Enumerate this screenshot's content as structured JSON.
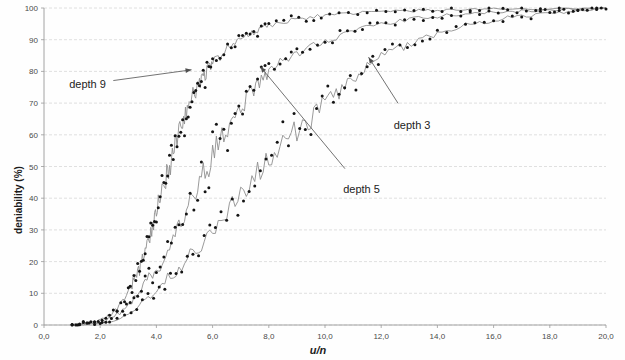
{
  "chart_data": {
    "type": "line",
    "title": "",
    "xlabel": "u/n",
    "ylabel": "deniability (%)",
    "xlim": [
      0.0,
      20.0
    ],
    "ylim": [
      0,
      100
    ],
    "grid": true,
    "legend_position": "inline-annotations",
    "x_tick_labels": [
      "0,0",
      "2,0",
      "4,0",
      "6,0",
      "8,0",
      "10,0",
      "12,0",
      "14,0",
      "16,0",
      "18,0",
      "20,0"
    ],
    "x_tick_values": [
      0,
      2,
      4,
      6,
      8,
      10,
      12,
      14,
      16,
      18,
      20
    ],
    "y_tick_labels": [
      "0",
      "10",
      "20",
      "30",
      "40",
      "50",
      "60",
      "70",
      "80",
      "90",
      "100"
    ],
    "y_tick_values": [
      0,
      10,
      20,
      30,
      40,
      50,
      60,
      70,
      80,
      90,
      100
    ],
    "annotations": [
      {
        "text": "depth 9",
        "label_x": 1.55,
        "label_y": 76,
        "point_x": 5.25,
        "point_y": 80.5
      },
      {
        "text": "depth 3",
        "label_x": 13.1,
        "label_y": 63,
        "point_x": 11.55,
        "point_y": 84.5
      },
      {
        "text": "depth 5",
        "label_x": 11.3,
        "label_y": 43,
        "point_x": 7.7,
        "point_y": 81.5
      }
    ],
    "series": [
      {
        "name": "depth 9",
        "color": "#141414",
        "x": [
          1.0,
          1.2,
          1.4,
          1.6,
          1.8,
          2.0,
          2.2,
          2.4,
          2.6,
          2.8,
          3.0,
          3.1,
          3.2,
          3.3,
          3.4,
          3.5,
          3.6,
          3.7,
          3.8,
          3.9,
          4.0,
          4.1,
          4.2,
          4.3,
          4.4,
          4.5,
          4.6,
          4.7,
          4.8,
          4.9,
          5.0,
          5.1,
          5.2,
          5.3,
          5.4,
          5.5,
          5.6,
          5.7,
          5.8,
          5.9,
          6.0,
          6.2,
          6.4,
          6.6,
          6.8,
          7.0,
          7.2,
          7.4,
          7.6,
          7.8,
          8.0,
          8.4,
          8.8,
          9.2,
          9.6,
          10.0,
          10.5,
          11.0,
          11.5,
          12.0,
          12.5,
          13.0,
          13.5,
          14.0,
          14.5,
          15.0,
          15.5,
          16.0,
          17.0,
          18.0,
          19.0,
          20.0
        ],
        "y": [
          0.2,
          0.3,
          0.4,
          0.6,
          0.9,
          1.4,
          2.2,
          3.4,
          5.0,
          7.4,
          10.5,
          12.0,
          14.2,
          16.8,
          17.2,
          20.8,
          24.4,
          25.8,
          29.6,
          32.0,
          35.4,
          38.8,
          41.0,
          44.8,
          48.0,
          51.5,
          54.8,
          57.6,
          60.8,
          63.0,
          65.8,
          68.5,
          70.2,
          72.6,
          74.0,
          75.6,
          77.4,
          78.8,
          80.2,
          81.0,
          82.4,
          84.6,
          86.0,
          87.8,
          89.0,
          90.2,
          91.4,
          92.2,
          93.0,
          93.8,
          94.4,
          95.4,
          96.2,
          96.8,
          97.2,
          97.6,
          98.0,
          98.3,
          98.6,
          98.8,
          99.0,
          99.1,
          99.2,
          99.3,
          99.4,
          99.5,
          99.5,
          99.6,
          99.7,
          99.8,
          99.9,
          100.0
        ]
      },
      {
        "name": "depth 5",
        "color": "#141414",
        "x": [
          1.0,
          1.3,
          1.6,
          1.9,
          2.2,
          2.5,
          2.8,
          3.0,
          3.2,
          3.4,
          3.6,
          3.8,
          4.0,
          4.2,
          4.4,
          4.6,
          4.8,
          5.0,
          5.2,
          5.4,
          5.6,
          5.8,
          6.0,
          6.2,
          6.4,
          6.6,
          6.8,
          7.0,
          7.2,
          7.4,
          7.6,
          7.8,
          8.0,
          8.3,
          8.6,
          8.9,
          9.2,
          9.6,
          10.0,
          10.4,
          10.8,
          11.2,
          11.6,
          12.0,
          12.5,
          13.0,
          13.5,
          14.0,
          14.5,
          15.0,
          15.5,
          16.0,
          16.5,
          17.0,
          17.5,
          18.0,
          18.5,
          19.0,
          19.5,
          20.0
        ],
        "y": [
          0.2,
          0.3,
          0.5,
          0.8,
          1.4,
          2.6,
          4.6,
          6.2,
          8.2,
          10.6,
          13.4,
          16.0,
          17.2,
          19.0,
          22.4,
          26.8,
          30.2,
          33.4,
          38.2,
          42.6,
          46.0,
          49.6,
          53.2,
          56.8,
          59.4,
          62.8,
          65.0,
          68.4,
          71.2,
          73.0,
          75.8,
          77.4,
          79.6,
          82.0,
          83.4,
          85.2,
          86.6,
          88.4,
          89.8,
          91.0,
          92.2,
          93.2,
          94.0,
          94.8,
          95.6,
          96.3,
          96.9,
          97.4,
          97.8,
          98.1,
          98.4,
          98.6,
          98.8,
          99.0,
          99.2,
          99.3,
          99.5,
          99.6,
          99.8,
          100.0
        ]
      },
      {
        "name": "depth 3",
        "color": "#141414",
        "x": [
          1.0,
          1.4,
          1.8,
          2.2,
          2.6,
          3.0,
          3.3,
          3.6,
          3.9,
          4.2,
          4.5,
          4.8,
          5.1,
          5.4,
          5.7,
          6.0,
          6.3,
          6.6,
          6.9,
          7.2,
          7.5,
          7.8,
          8.1,
          8.4,
          8.7,
          9.0,
          9.3,
          9.6,
          9.9,
          10.2,
          10.5,
          10.8,
          11.1,
          11.4,
          11.7,
          12.0,
          12.4,
          12.8,
          13.2,
          13.6,
          14.0,
          14.5,
          15.0,
          15.5,
          16.0,
          16.5,
          17.0,
          17.5,
          18.0,
          18.5,
          19.0,
          19.5,
          20.0
        ],
        "y": [
          0.2,
          0.3,
          0.5,
          1.0,
          2.0,
          3.8,
          5.6,
          7.8,
          10.2,
          13.0,
          16.0,
          17.4,
          21.2,
          24.6,
          26.2,
          29.8,
          33.6,
          37.0,
          39.4,
          43.8,
          46.8,
          48.2,
          52.4,
          56.0,
          58.6,
          61.4,
          64.2,
          65.8,
          69.4,
          71.0,
          73.8,
          76.2,
          77.0,
          80.4,
          82.2,
          84.6,
          86.4,
          88.0,
          89.6,
          90.8,
          92.0,
          93.4,
          94.4,
          95.4,
          96.2,
          96.9,
          97.4,
          97.9,
          98.3,
          98.7,
          99.1,
          99.5,
          100.0
        ]
      }
    ]
  },
  "figure": {
    "background_color": "#fefefe",
    "grid_color": "#d8d8d8",
    "axis_color": "#9a9a9a",
    "marker_color": "#141414",
    "line_color": "#8f8f8f",
    "annotation_color": "#222222"
  }
}
